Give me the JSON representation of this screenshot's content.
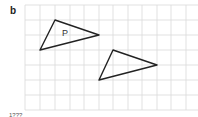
{
  "figure": {
    "label": "b",
    "footer_text": "1???"
  },
  "grid": {
    "x_lines": [
      25,
      40,
      55,
      70,
      84,
      99,
      113,
      128,
      142,
      157,
      171,
      186
    ],
    "y_lines": [
      5,
      20,
      35,
      50,
      65,
      80,
      95,
      110
    ],
    "color": "#d9d9d9"
  },
  "shapes": [
    {
      "name": "triangle-p",
      "label": "P",
      "points": "55,20 99,35 40,50",
      "label_pos": [
        62,
        36
      ]
    },
    {
      "name": "triangle-image",
      "label": "",
      "points": "113,50 157,65 99,80"
    }
  ],
  "stroke_color": "#222222"
}
